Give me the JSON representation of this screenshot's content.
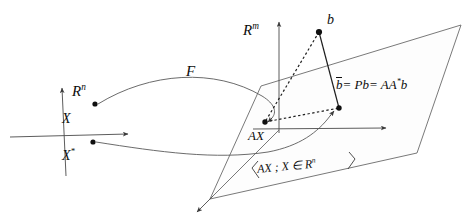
{
  "figure": {
    "domain_label": "R",
    "domain_exponent": "n",
    "codomain_label": "R",
    "codomain_exponent": "m",
    "map_label": "F",
    "point_x_label": "X",
    "point_xstar_label": "X",
    "point_xstar_exponent": "*",
    "point_b_label": "b",
    "point_ax_label": "AX",
    "projection_equation": {
      "lhs": "b",
      "lhs_overbar": true,
      "part1": "= Pb",
      "part2": "= AA",
      "exponent": "*",
      "part3": "b",
      "full_text": "b̄ = Pb = AA* b"
    },
    "range_set_label": {
      "open_brace": "{",
      "body": "AX ; X ∈ R",
      "exponent": "n",
      "close_brace": "}",
      "full_text": "{AX ; X ∈ Rⁿ}"
    },
    "colors": {
      "stroke": "#4a4a4a",
      "ink": "#0d0d0d",
      "plane_fill": "#fcfcfc",
      "background": "#ffffff"
    },
    "geometry": {
      "axis_origin": [
        64,
        135
      ],
      "axis_vertical_top": [
        62,
        86
      ],
      "axis_vertical_bottom": [
        66,
        175
      ],
      "axis_horizontal_left": [
        10,
        137
      ],
      "axis_horizontal_right": [
        130,
        134
      ],
      "point_X": [
        95,
        104
      ],
      "point_Xstar": [
        93,
        142
      ],
      "point_b": [
        319,
        32
      ],
      "point_bbar": [
        339,
        108
      ],
      "point_AX": [
        265,
        122
      ],
      "plane_vertices": [
        [
          261,
          86
        ],
        [
          461,
          25
        ],
        [
          417,
          153
        ],
        [
          210,
          199
        ]
      ],
      "vertical_axis_rm_top": [
        279,
        20
      ],
      "vertical_axis_rm_bottom": [
        279,
        133
      ],
      "horizontal_axis_rm_right": [
        388,
        128
      ]
    }
  }
}
